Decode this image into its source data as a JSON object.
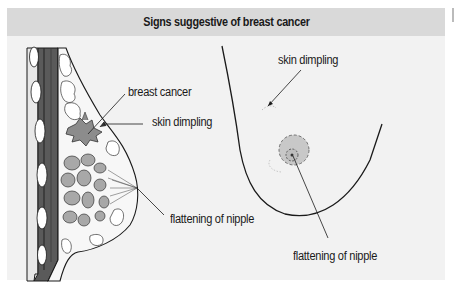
{
  "figure": {
    "title": "Signs suggestive of breast cancer",
    "colors": {
      "panel_background": "#f2f2f2",
      "header_background": "#d9d9d9",
      "muscle_dark": "#5a5a5a",
      "lobule_grey": "#a8a8a8",
      "tumor_grey": "#8c8c8c",
      "areola_grey": "#c8c8c8",
      "outline": "#1a1a1a"
    },
    "left_panel": {
      "view": "cross-section of breast",
      "labels": {
        "breast_cancer": "breast cancer",
        "skin_dimpling": "skin dimpling",
        "flattening_of_nipple": "flattening of nipple"
      }
    },
    "right_panel": {
      "view": "external view of breast",
      "labels": {
        "skin_dimpling": "skin dimpling",
        "flattening_of_nipple": "flattening of nipple"
      }
    }
  }
}
